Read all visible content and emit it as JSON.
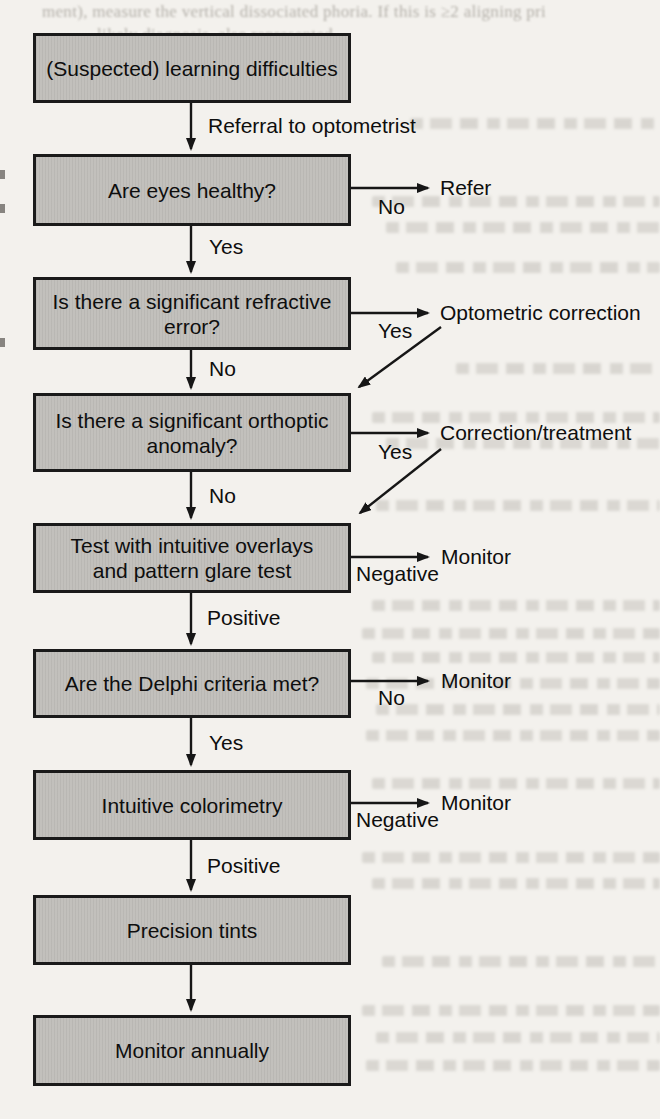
{
  "bleedthrough": {
    "line1": "ment), measure the vertical dissociated phoria. If this is ≥2 aligning pri",
    "line2": ", likely diagnosis, also represented"
  },
  "colors": {
    "background": "#f3f1ed",
    "box_fill": "#c0beba",
    "box_border": "#1a1a1a",
    "arrow": "#161616",
    "text": "#0e0e0e"
  },
  "flowchart": {
    "boxes": [
      {
        "id": "learning-difficulties",
        "lines": [
          "(Suspected) learning difficulties"
        ]
      },
      {
        "id": "eyes-healthy",
        "lines": [
          "Are eyes healthy?"
        ]
      },
      {
        "id": "refractive-error",
        "lines": [
          "Is there a significant refractive",
          "error?"
        ]
      },
      {
        "id": "orthoptic-anomaly",
        "lines": [
          "Is there a significant orthoptic",
          "anomaly?"
        ]
      },
      {
        "id": "overlays-pattern-glare",
        "lines": [
          "Test with intuitive overlays",
          "and pattern glare test"
        ]
      },
      {
        "id": "delphi-criteria",
        "lines": [
          "Are the Delphi criteria met?"
        ]
      },
      {
        "id": "intuitive-colorimetry",
        "lines": [
          "Intuitive colorimetry"
        ]
      },
      {
        "id": "precision-tints",
        "lines": [
          "Precision tints"
        ]
      },
      {
        "id": "monitor-annually",
        "lines": [
          "Monitor annually"
        ]
      }
    ],
    "edge_labels": {
      "referral": "Referral to optometrist",
      "no_eyes": "No",
      "yes_eyes": "Yes",
      "yes_refractive": "Yes",
      "no_refractive": "No",
      "yes_orthoptic": "Yes",
      "no_orthoptic": "No",
      "negative_overlays": "Negative",
      "positive_overlays": "Positive",
      "no_delphi": "No",
      "yes_delphi": "Yes",
      "negative_colorimetry": "Negative",
      "positive_colorimetry": "Positive"
    },
    "outcomes": {
      "refer": "Refer",
      "optometric_correction": "Optometric correction",
      "correction_treatment": "Correction/treatment",
      "monitor_overlays": "Monitor",
      "monitor_delphi": "Monitor",
      "monitor_colorimetry": "Monitor"
    }
  }
}
